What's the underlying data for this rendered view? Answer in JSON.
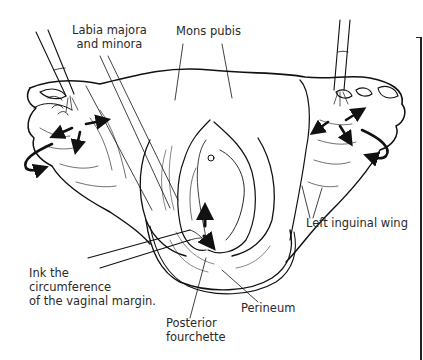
{
  "figure": {
    "type": "anatomical line illustration",
    "labels": {
      "labia": {
        "line1": "Labia majora",
        "line2": "and minora"
      },
      "mons": {
        "text": "Mons pubis"
      },
      "inguinal": {
        "text": "Left inguinal wing"
      },
      "ink": {
        "line1": "Ink the",
        "line2": "circumference",
        "line3": "of the vaginal margin."
      },
      "fourchette": {
        "line1": "Posterior",
        "line2": "fourchette"
      },
      "perineum": {
        "text": "Perineum"
      }
    },
    "colors": {
      "ink": "#111111",
      "background": "#ffffff",
      "label_text": "#2a2a2a"
    }
  }
}
